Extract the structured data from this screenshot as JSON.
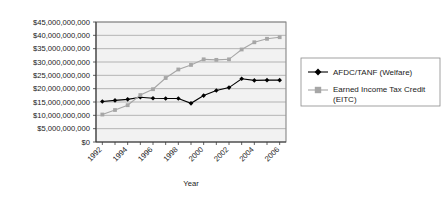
{
  "chart_data": {
    "type": "line",
    "title": "",
    "xlabel": "Year",
    "ylabel": "",
    "grid": true,
    "legend_position": "right",
    "x": [
      1992,
      1993,
      1994,
      1995,
      1996,
      1997,
      1998,
      1999,
      2000,
      2001,
      2002,
      2003,
      2004,
      2005,
      2006
    ],
    "categories": [
      "1992",
      "1993",
      "1994",
      "1995",
      "1996",
      "1997",
      "1998",
      "1999",
      "2000",
      "2001",
      "2002",
      "2003",
      "2004",
      "2005",
      "2006"
    ],
    "xtick_labels": [
      "1992",
      "1994",
      "1996",
      "1998",
      "2000",
      "2002",
      "2004",
      "2006"
    ],
    "xtick_values": [
      1992,
      1994,
      1996,
      1998,
      2000,
      2002,
      2004,
      2006
    ],
    "xlim": [
      1991.5,
      2006.5
    ],
    "ylim": [
      0,
      45000000000
    ],
    "ytick_labels": [
      "$45,000,000,000",
      "$40,000,000,000",
      "$35,000,000,000",
      "$30,000,000,000",
      "$25,000,000,000",
      "$20,000,000,000",
      "$15,000,000,000",
      "$10,000,000,000",
      "$5,000,000,000",
      "$0"
    ],
    "ytick_values": [
      45000000000,
      40000000000,
      35000000000,
      30000000000,
      25000000000,
      20000000000,
      15000000000,
      10000000000,
      5000000000,
      0
    ],
    "series": [
      {
        "name": "AFDC/TANF (Welfare)",
        "color": "#000000",
        "marker": "diamond",
        "values": [
          15200000000,
          15600000000,
          16000000000,
          16800000000,
          16400000000,
          16300000000,
          16300000000,
          14500000000,
          17400000000,
          19300000000,
          20400000000,
          23700000000,
          23100000000,
          23200000000,
          23200000000
        ]
      },
      {
        "name": "Earned Income Tax Credit (EITC)",
        "color": "#a6a6a6",
        "marker": "square",
        "values": [
          10300000000,
          12000000000,
          13800000000,
          17600000000,
          19800000000,
          24000000000,
          27200000000,
          28900000000,
          31000000000,
          30800000000,
          31000000000,
          34700000000,
          37400000000,
          38700000000,
          39300000000
        ]
      }
    ]
  },
  "legend": {
    "items": [
      {
        "label": "AFDC/TANF (Welfare)",
        "marker": "diamond",
        "color": "#000000"
      },
      {
        "label": "Earned Income Tax Credit (EITC)",
        "label_line1": "Earned Income Tax Credit",
        "label_line2": "(EITC)",
        "marker": "square",
        "color": "#a6a6a6"
      }
    ]
  },
  "axis": {
    "x_title": "Year"
  }
}
